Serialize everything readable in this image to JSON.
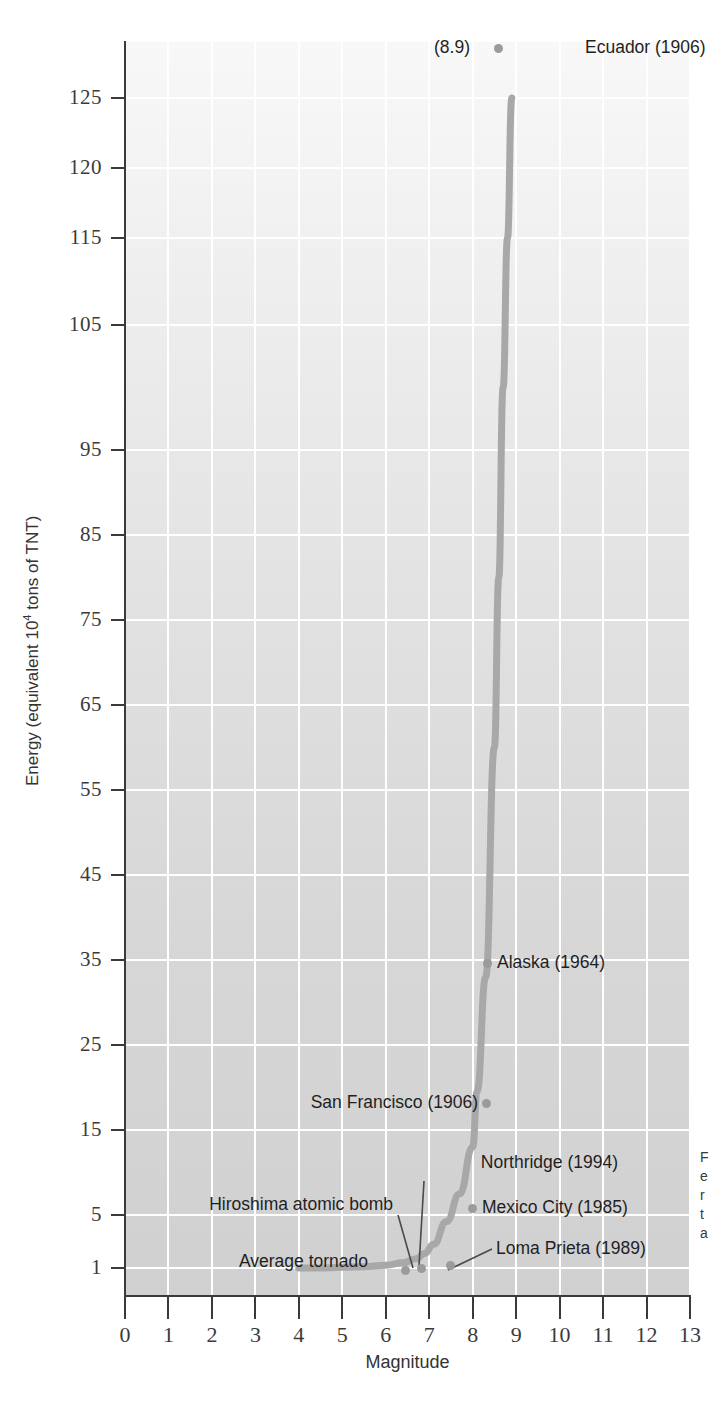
{
  "chart_data": {
    "type": "line",
    "title": "",
    "xlabel": "Magnitude",
    "ylabel": "Energy (equivalent 10⁴ tons of TNT)",
    "ylabel_parts": {
      "prefix": "Energy (equivalent 10",
      "sup": "4",
      "suffix": " tons of TNT)"
    },
    "xlim": [
      0,
      13
    ],
    "ylim": [
      1,
      125
    ],
    "grid": true,
    "legend": "none",
    "x_ticks": [
      "0",
      "1",
      "2",
      "3",
      "4",
      "5",
      "6",
      "7",
      "8",
      "9",
      "10",
      "11",
      "12",
      "13"
    ],
    "y_ticks": [
      "1",
      "5",
      "15",
      "25",
      "35",
      "45",
      "55",
      "65",
      "75",
      "85",
      "95",
      "105",
      "115",
      "120",
      "125"
    ],
    "x": [
      4.0,
      4.5,
      5.0,
      5.5,
      6.0,
      6.4,
      6.7,
      6.9,
      7.1,
      7.4,
      7.7,
      8.0,
      8.1,
      8.3,
      8.5,
      8.6,
      8.7,
      8.8,
      8.9
    ],
    "y": [
      1.0,
      1.0,
      1.05,
      1.1,
      1.2,
      1.4,
      1.7,
      2.1,
      2.8,
      4.5,
      7.5,
      13.0,
      19.5,
      33.0,
      60.0,
      80.0,
      100.0,
      115.0,
      125.0
    ],
    "annotations": [
      {
        "id": "ecuador",
        "label": "Ecuador (1906)",
        "value_label": "(8.9)",
        "magnitude": 8.9,
        "energy": 125,
        "side": "right"
      },
      {
        "id": "alaska",
        "label": "Alaska (1964)",
        "magnitude": 8.4,
        "energy": 33,
        "side": "right"
      },
      {
        "id": "san-francisco",
        "label": "San Francisco (1906)",
        "magnitude": 8.3,
        "energy": 19.5,
        "side": "left"
      },
      {
        "id": "mexico-city",
        "label": "Mexico City (1985)",
        "magnitude": 8.1,
        "energy": 7.5,
        "side": "right"
      },
      {
        "id": "loma-prieta",
        "label": "Loma Prieta (1989)",
        "magnitude": 7.1,
        "energy": 1.3,
        "side": "right"
      },
      {
        "id": "northridge",
        "label": "Northridge (1994)",
        "magnitude": 6.7,
        "energy": 1.15,
        "side": "right"
      },
      {
        "id": "hiroshima",
        "label": "Hiroshima atomic bomb",
        "magnitude": 6.5,
        "energy": 1.1,
        "side": "left"
      },
      {
        "id": "average-tornado",
        "label": "Average tornado",
        "magnitude": 4.0,
        "energy": 1.0,
        "side": "left"
      }
    ]
  },
  "colors": {
    "curve": "#a8a8a8",
    "dot": "#9b9b9b",
    "grid": "#ffffff",
    "axis": "#3a3a3a",
    "text": "#1f1f1f",
    "plot_bg_top": "#fbfbfb",
    "plot_bg_bottom": "#d3d3d3"
  },
  "caption_sliver": {
    "l1": "F",
    "l2": "e",
    "l3": "r",
    "l4": "t",
    "l5": "a"
  }
}
